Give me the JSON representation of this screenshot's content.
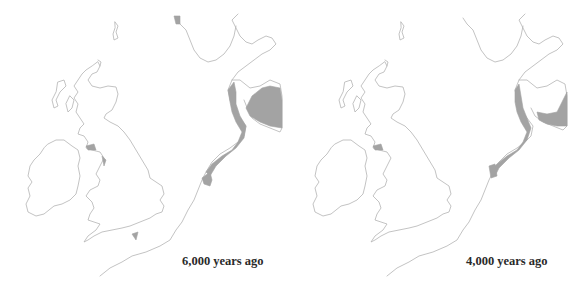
{
  "panels": [
    {
      "id": "left",
      "label": "6,000 years ago",
      "region": "British Isles and North Sea coast",
      "flood_color": "#a3a3a3",
      "coast_color": "#b4b4b4"
    },
    {
      "id": "right",
      "label": "4,000 years ago",
      "region": "British Isles and North Sea coast",
      "flood_color": "#a3a3a3",
      "coast_color": "#b4b4b4"
    }
  ]
}
